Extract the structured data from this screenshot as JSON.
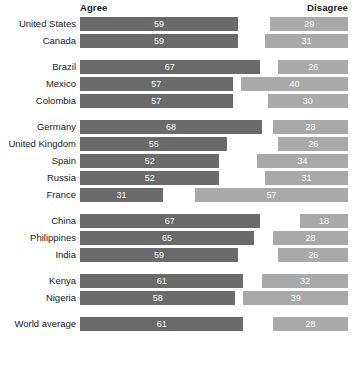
{
  "header": {
    "agree_label": "Agree",
    "disagree_label": "Disagree"
  },
  "colors": {
    "agree": "#6a6a6a",
    "disagree": "#a9a9a9",
    "value_text": "#ffffff",
    "label_text": "#1a1a1a",
    "background": "#ffffff"
  },
  "chart_data": {
    "type": "bar",
    "title": "",
    "subtitle": "",
    "xlabel": "",
    "ylabel": "",
    "orientation": "horizontal",
    "grid": false,
    "legend_position": "top",
    "axis_range": [
      0,
      100
    ],
    "units": "percent",
    "agree_alignment": "left",
    "disagree_alignment": "right",
    "series": [
      {
        "name": "Agree",
        "color": "#6a6a6a"
      },
      {
        "name": "Disagree",
        "color": "#a9a9a9"
      }
    ],
    "categories": [
      "United States",
      "Canada",
      "Brazil",
      "Mexico",
      "Colombia",
      "Germany",
      "United Kingdom",
      "Spain",
      "Russia",
      "France",
      "China",
      "Philippines",
      "India",
      "Kenya",
      "Nigeria",
      "World average"
    ],
    "groups": [
      {
        "name": "North America",
        "rows": [
          {
            "label": "United States",
            "agree": 59,
            "disagree": 29
          },
          {
            "label": "Canada",
            "agree": 59,
            "disagree": 31
          }
        ]
      },
      {
        "name": "Latin America",
        "rows": [
          {
            "label": "Brazil",
            "agree": 67,
            "disagree": 26
          },
          {
            "label": "Mexico",
            "agree": 57,
            "disagree": 40
          },
          {
            "label": "Colombia",
            "agree": 57,
            "disagree": 30
          }
        ]
      },
      {
        "name": "Europe",
        "rows": [
          {
            "label": "Germany",
            "agree": 68,
            "disagree": 28
          },
          {
            "label": "United Kingdom",
            "agree": 55,
            "disagree": 26
          },
          {
            "label": "Spain",
            "agree": 52,
            "disagree": 34
          },
          {
            "label": "Russia",
            "agree": 52,
            "disagree": 31
          },
          {
            "label": "France",
            "agree": 31,
            "disagree": 57
          }
        ]
      },
      {
        "name": "Asia",
        "rows": [
          {
            "label": "China",
            "agree": 67,
            "disagree": 18
          },
          {
            "label": "Philippines",
            "agree": 65,
            "disagree": 28
          },
          {
            "label": "India",
            "agree": 59,
            "disagree": 26
          }
        ]
      },
      {
        "name": "Africa",
        "rows": [
          {
            "label": "Kenya",
            "agree": 61,
            "disagree": 32
          },
          {
            "label": "Nigeria",
            "agree": 58,
            "disagree": 39
          }
        ]
      },
      {
        "name": "Overall",
        "rows": [
          {
            "label": "World average",
            "agree": 61,
            "disagree": 28
          }
        ]
      }
    ]
  }
}
